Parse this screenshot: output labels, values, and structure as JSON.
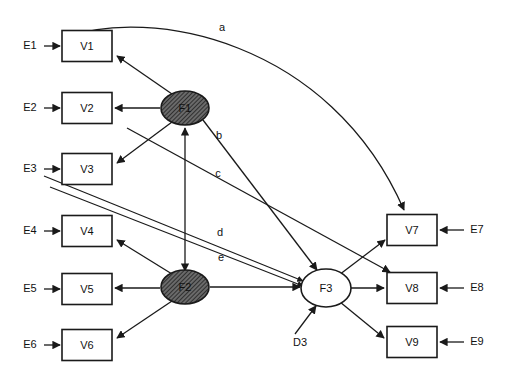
{
  "diagram": {
    "type": "path-diagram",
    "canvas": {
      "width": 505,
      "height": 380
    },
    "colors": {
      "background": "#ffffff",
      "stroke": "#1a1a1a",
      "shaded_fill": "#5d5d5d",
      "open_fill": "#ffffff"
    },
    "observed_variables": [
      {
        "id": "V1",
        "label": "V1",
        "x": 87,
        "y": 46,
        "w": 50,
        "h": 31
      },
      {
        "id": "V2",
        "label": "V2",
        "x": 87,
        "y": 108,
        "w": 50,
        "h": 31
      },
      {
        "id": "V3",
        "label": "V3",
        "x": 87,
        "y": 169,
        "w": 50,
        "h": 31
      },
      {
        "id": "V4",
        "label": "V4",
        "x": 87,
        "y": 231,
        "w": 50,
        "h": 31
      },
      {
        "id": "V5",
        "label": "V5",
        "x": 87,
        "y": 289,
        "w": 50,
        "h": 31
      },
      {
        "id": "V6",
        "label": "V6",
        "x": 87,
        "y": 345,
        "w": 50,
        "h": 31
      },
      {
        "id": "V7",
        "label": "V7",
        "x": 412,
        "y": 230,
        "w": 50,
        "h": 31
      },
      {
        "id": "V8",
        "label": "V8",
        "x": 412,
        "y": 288,
        "w": 50,
        "h": 31
      },
      {
        "id": "V9",
        "label": "V9",
        "x": 412,
        "y": 342,
        "w": 50,
        "h": 31
      }
    ],
    "latent_variables": [
      {
        "id": "F1",
        "label": "F1",
        "cx": 185,
        "cy": 108,
        "rx": 24,
        "ry": 17,
        "fill": "shaded"
      },
      {
        "id": "F2",
        "label": "F2",
        "cx": 185,
        "cy": 287,
        "rx": 24,
        "ry": 17,
        "fill": "shaded"
      },
      {
        "id": "F3",
        "label": "F3",
        "cx": 326,
        "cy": 288,
        "rx": 24,
        "ry": 19,
        "fill": "open"
      }
    ],
    "residuals": [
      {
        "id": "E1",
        "label": "E1",
        "x": 30,
        "y": 46
      },
      {
        "id": "E2",
        "label": "E2",
        "x": 30,
        "y": 108
      },
      {
        "id": "E3",
        "label": "E3",
        "x": 30,
        "y": 169
      },
      {
        "id": "E4",
        "label": "E4",
        "x": 30,
        "y": 231
      },
      {
        "id": "E5",
        "label": "E5",
        "x": 30,
        "y": 289
      },
      {
        "id": "E6",
        "label": "E6",
        "x": 30,
        "y": 345
      },
      {
        "id": "E7",
        "label": "E7",
        "x": 477,
        "y": 230
      },
      {
        "id": "E8",
        "label": "E8",
        "x": 477,
        "y": 288
      },
      {
        "id": "E9",
        "label": "E9",
        "x": 477,
        "y": 342
      },
      {
        "id": "D3",
        "label": "D3",
        "x": 300,
        "y": 343
      }
    ],
    "path_labels": [
      {
        "id": "a",
        "label": "a",
        "x": 222,
        "y": 28
      },
      {
        "id": "b",
        "label": "b",
        "x": 219,
        "y": 136
      },
      {
        "id": "c",
        "label": "c",
        "x": 218,
        "y": 174
      },
      {
        "id": "d",
        "label": "d",
        "x": 220,
        "y": 233
      },
      {
        "id": "e",
        "label": "e",
        "x": 221,
        "y": 258
      }
    ],
    "edges": [
      {
        "from": "E1",
        "to": "V1",
        "kind": "residual-arrow"
      },
      {
        "from": "E2",
        "to": "V2",
        "kind": "residual-arrow"
      },
      {
        "from": "E3",
        "to": "V3",
        "kind": "residual-arrow"
      },
      {
        "from": "E4",
        "to": "V4",
        "kind": "residual-arrow"
      },
      {
        "from": "E5",
        "to": "V5",
        "kind": "residual-arrow"
      },
      {
        "from": "E6",
        "to": "V6",
        "kind": "residual-arrow"
      },
      {
        "from": "E7",
        "to": "V7",
        "kind": "residual-arrow"
      },
      {
        "from": "E8",
        "to": "V8",
        "kind": "residual-arrow"
      },
      {
        "from": "E9",
        "to": "V9",
        "kind": "residual-arrow"
      },
      {
        "from": "D3",
        "to": "F3",
        "kind": "disturbance-arrow"
      },
      {
        "from": "F1",
        "to": "V1",
        "kind": "loading"
      },
      {
        "from": "F1",
        "to": "V2",
        "kind": "loading"
      },
      {
        "from": "F1",
        "to": "V3",
        "kind": "loading"
      },
      {
        "from": "F2",
        "to": "V4",
        "kind": "loading"
      },
      {
        "from": "F2",
        "to": "V5",
        "kind": "loading"
      },
      {
        "from": "F2",
        "to": "V6",
        "kind": "loading"
      },
      {
        "from": "F3",
        "to": "V7",
        "kind": "loading"
      },
      {
        "from": "F3",
        "to": "V8",
        "kind": "loading"
      },
      {
        "from": "F3",
        "to": "V9",
        "kind": "loading"
      },
      {
        "from": "F2",
        "to": "F1",
        "kind": "structural-double"
      },
      {
        "from": "F2",
        "to": "F3",
        "kind": "structural"
      },
      {
        "from": "F1",
        "to": "F3",
        "kind": "structural",
        "label": "b"
      },
      {
        "from": "V1",
        "to": "V7",
        "kind": "curved-cross-loading",
        "label": "a"
      },
      {
        "from": "V2",
        "to": "V8",
        "kind": "cross-loading",
        "label": "c"
      },
      {
        "from": "E3",
        "to": "F3",
        "kind": "cross-path",
        "label": "d"
      },
      {
        "from": "V3",
        "to": "F3",
        "kind": "cross-path",
        "label": "e"
      }
    ]
  }
}
